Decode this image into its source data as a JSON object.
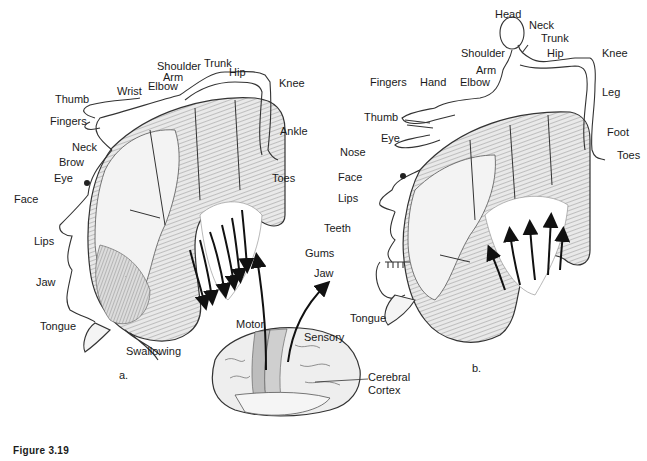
{
  "figure": {
    "caption": "Figure 3.19"
  },
  "panel_a": {
    "letter": "a.",
    "title": "Motor homunculus",
    "labels": {
      "shoulder": "Shoulder",
      "trunk": "Trunk",
      "hip": "Hip",
      "arm": "Arm",
      "elbow": "Elbow",
      "wrist": "Wrist",
      "knee": "Knee",
      "thumb": "Thumb",
      "fingers": "Fingers",
      "neck": "Neck",
      "ankle": "Ankle",
      "brow": "Brow",
      "eye": "Eye",
      "toes": "Toes",
      "face": "Face",
      "lips": "Lips",
      "jaw": "Jaw",
      "tongue": "Tongue",
      "swallowing": "Swallowing"
    }
  },
  "panel_b": {
    "letter": "b.",
    "title": "Sensory homunculus",
    "labels": {
      "head": "Head",
      "neck": "Neck",
      "trunk": "Trunk",
      "shoulder": "Shoulder",
      "hip": "Hip",
      "knee": "Knee",
      "arm": "Arm",
      "fingers": "Fingers",
      "hand": "Hand",
      "elbow": "Elbow",
      "leg": "Leg",
      "thumb": "Thumb",
      "eye": "Eye",
      "nose": "Nose",
      "foot": "Foot",
      "toes": "Toes",
      "face": "Face",
      "lips": "Lips",
      "teeth": "Teeth",
      "gums": "Gums",
      "jaw": "Jaw",
      "tongue": "Tongue"
    }
  },
  "brain": {
    "motor": "Motor",
    "sensory": "Sensory",
    "cortex_line1": "Cerebral",
    "cortex_line2": "Cortex"
  },
  "colors": {
    "ink": "#1a1a1a",
    "cortex_fill": "#e6e6e6",
    "cortex_shade": "#b8b8b8",
    "strip_fill": "#bdbdbd",
    "paper": "#ffffff"
  }
}
